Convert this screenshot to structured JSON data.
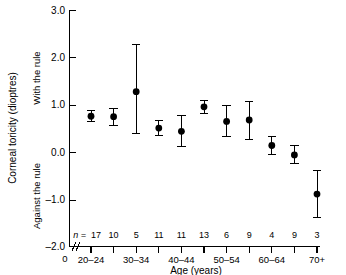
{
  "chart_data": {
    "type": "scatter",
    "title": "",
    "xlabel": "Age (years)",
    "ylabel": "Corneal toricity (dioptres)",
    "ylim": [
      -2.0,
      3.0
    ],
    "yticks": [
      "3.0",
      "2.0",
      "1.0",
      "0.0",
      "–1.0",
      "–2.0"
    ],
    "ytick_values": [
      3.0,
      2.0,
      1.0,
      0.0,
      -1.0,
      -2.0
    ],
    "grid": false,
    "legend": "none",
    "origin_label": "0",
    "axis_break": true,
    "region_labels": {
      "positive": "With the rule",
      "negative": "Against the rule"
    },
    "n_prefix": "n =",
    "categories": [
      "20–24",
      "",
      "30–34",
      "",
      "40–44",
      "",
      "50–54",
      "",
      "60–64",
      "",
      "70+"
    ],
    "categories_full": [
      "20–24",
      "25–29",
      "30–34",
      "35–39",
      "40–44",
      "45–49",
      "50–54",
      "55–59",
      "60–64",
      "65–69",
      "70+"
    ],
    "xtick_labels_shown": [
      "20–24",
      "30–34",
      "40–44",
      "50–54",
      "60–64",
      "70+"
    ],
    "values": [
      0.76,
      0.75,
      1.28,
      0.51,
      0.44,
      0.96,
      0.65,
      0.68,
      0.14,
      -0.06,
      -0.89
    ],
    "err_low": [
      0.64,
      0.56,
      0.39,
      0.35,
      0.12,
      0.82,
      0.32,
      0.27,
      -0.05,
      -0.25,
      -1.39
    ],
    "err_high": [
      0.89,
      0.93,
      2.28,
      0.66,
      0.77,
      1.1,
      0.98,
      1.08,
      0.34,
      0.13,
      -0.4
    ],
    "n_values": [
      17,
      10,
      5,
      11,
      11,
      13,
      6,
      9,
      4,
      9,
      3
    ],
    "colors": {
      "marker": "#000000",
      "axis": "#000000",
      "background": "#ffffff"
    }
  }
}
